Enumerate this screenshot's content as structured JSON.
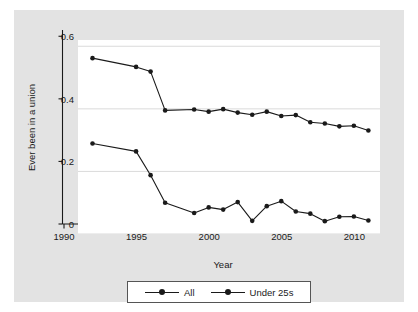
{
  "chart_data": {
    "type": "line",
    "title": "",
    "xlabel": "Year",
    "ylabel": "Ever been in a union",
    "xlim": [
      1990,
      2010.8
    ],
    "ylim": [
      0,
      0.62
    ],
    "xticks": [
      1990,
      1995,
      2000,
      2005,
      2010
    ],
    "yticks": [
      0,
      0.2,
      0.4,
      0.6
    ],
    "ytick_labels": [
      "0",
      "0.2",
      "0.4",
      "0.6"
    ],
    "xtick_labels": [
      "1990",
      "1995",
      "2000",
      "2005",
      "2010"
    ],
    "grid": "horizontal",
    "legend_position": "bottom",
    "marker": "circle",
    "line_color": "#1a1a1a",
    "plot_background": "#ffffff",
    "graph_background": "#e3e3e3",
    "series": [
      {
        "name": "All",
        "x": [
          1991,
          1994,
          1995,
          1996,
          1998,
          1999,
          2000,
          2001,
          2002,
          2003,
          2004,
          2005,
          2006,
          2007,
          2008,
          2009,
          2010
        ],
        "values": [
          0.562,
          0.534,
          0.519,
          0.395,
          0.398,
          0.391,
          0.399,
          0.388,
          0.381,
          0.391,
          0.377,
          0.38,
          0.357,
          0.353,
          0.344,
          0.346,
          0.331
        ]
      },
      {
        "name": "Under 25s",
        "x": [
          1991,
          1994,
          1995,
          1996,
          1998,
          1999,
          2000,
          2001,
          2002,
          2003,
          2004,
          2005,
          2006,
          2007,
          2008,
          2009,
          2010
        ],
        "values": [
          0.289,
          0.264,
          0.188,
          0.1,
          0.067,
          0.085,
          0.078,
          0.102,
          0.042,
          0.089,
          0.105,
          0.072,
          0.065,
          0.041,
          0.055,
          0.056,
          0.043
        ]
      }
    ]
  },
  "legend": {
    "entries": [
      {
        "label": "All",
        "marker": "circle-marker-icon"
      },
      {
        "label": "Under 25s",
        "marker": "circle-marker-icon"
      }
    ]
  }
}
